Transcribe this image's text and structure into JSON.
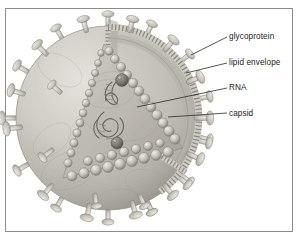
{
  "figure": {
    "kind": "scientific-illustration",
    "frame_border_color": "#8c8c8c",
    "background_color": "#ffffff",
    "leader_line_color": "#2b2b2b",
    "palette": {
      "envelope_light": "#d8d6cf",
      "envelope_mid": "#b9b6ad",
      "envelope_dark": "#8e8b82",
      "capsid_light": "#c9c6bd",
      "capsid_shadow": "#6f6c64",
      "spike_fill": "#cfccc4"
    }
  },
  "labels": [
    {
      "id": "glycoprotein",
      "text": "glycoprotein"
    },
    {
      "id": "lipid_envelope",
      "text": "lipid envelope"
    },
    {
      "id": "rna",
      "text": "RNA"
    },
    {
      "id": "capsid",
      "text": "capsid"
    }
  ]
}
